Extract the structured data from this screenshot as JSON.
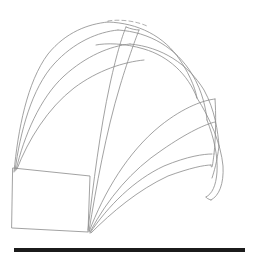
{
  "figure": {
    "canvas": {
      "width": 253,
      "height": 257,
      "background": "#ffffff"
    },
    "style": {
      "curve_color": "#8a8a8a",
      "dashed_color": "#9a9a9a",
      "rule_color": "#1b1b1b",
      "curve_width": 0.8,
      "rule_width": 4
    }
  },
  "chart_data": {
    "type": "line",
    "subtitle": "",
    "xlabel": "",
    "ylabel": "",
    "xlim": [
      0,
      253
    ],
    "ylim": [
      0,
      257
    ],
    "grid": false,
    "legend": "none",
    "annotations": [],
    "tick_labels": {
      "x": [],
      "y": []
    },
    "series": [
      {
        "name": "base-plate-quad",
        "kind": "polygon",
        "points": [
          [
            13,
            168
          ],
          [
            90,
            176
          ],
          [
            88,
            232
          ],
          [
            12,
            228
          ]
        ]
      },
      {
        "name": "ribbon-1-outer-left-edge",
        "kind": "curve",
        "points": [
          [
            14,
            172
          ],
          [
            20,
            110
          ],
          [
            42,
            55
          ],
          [
            78,
            28
          ],
          [
            108,
            22
          ]
        ]
      },
      {
        "name": "ribbon-1-top-arc",
        "kind": "curve",
        "points": [
          [
            108,
            22
          ],
          [
            140,
            24
          ],
          [
            168,
            40
          ],
          [
            186,
            66
          ],
          [
            196,
            96
          ]
        ]
      },
      {
        "name": "ribbon-1-inner-return",
        "kind": "curve",
        "points": [
          [
            196,
            96
          ],
          [
            178,
            70
          ],
          [
            150,
            52
          ],
          [
            118,
            44
          ],
          [
            96,
            44
          ]
        ]
      },
      {
        "name": "ribbon-2-left-edge",
        "kind": "curve",
        "points": [
          [
            15,
            171
          ],
          [
            24,
            116
          ],
          [
            48,
            66
          ],
          [
            82,
            38
          ],
          [
            118,
            30
          ]
        ]
      },
      {
        "name": "ribbon-2-top-arc",
        "kind": "curve",
        "points": [
          [
            118,
            30
          ],
          [
            152,
            34
          ],
          [
            180,
            52
          ],
          [
            198,
            82
          ],
          [
            206,
            118
          ]
        ]
      },
      {
        "name": "ribbon-3-left-edge",
        "kind": "curve",
        "points": [
          [
            16,
            170
          ],
          [
            30,
            122
          ],
          [
            56,
            80
          ],
          [
            92,
            52
          ],
          [
            128,
            44
          ]
        ]
      },
      {
        "name": "ribbon-3-top-arc",
        "kind": "curve",
        "points": [
          [
            128,
            44
          ],
          [
            164,
            48
          ],
          [
            194,
            70
          ],
          [
            212,
            104
          ],
          [
            218,
            144
          ]
        ]
      },
      {
        "name": "ribbon-4-fan-edge",
        "kind": "curve",
        "points": [
          [
            17,
            169
          ],
          [
            36,
            128
          ],
          [
            66,
            92
          ],
          [
            104,
            68
          ],
          [
            142,
            60
          ]
        ]
      },
      {
        "name": "spine-vertical-long",
        "kind": "curve",
        "points": [
          [
            88,
            230
          ],
          [
            96,
            160
          ],
          [
            106,
            96
          ],
          [
            118,
            48
          ],
          [
            126,
            28
          ]
        ]
      },
      {
        "name": "spine-vertical-pair",
        "kind": "curve",
        "points": [
          [
            89,
            231
          ],
          [
            99,
            162
          ],
          [
            112,
            98
          ],
          [
            128,
            50
          ],
          [
            138,
            30
          ]
        ]
      },
      {
        "name": "ribbon-5-right-sweep-outer",
        "kind": "curve",
        "points": [
          [
            89,
            232
          ],
          [
            112,
            170
          ],
          [
            146,
            128
          ],
          [
            186,
            106
          ],
          [
            214,
            100
          ]
        ]
      },
      {
        "name": "ribbon-5-right-sweep-inner",
        "kind": "curve",
        "points": [
          [
            90,
            232
          ],
          [
            118,
            178
          ],
          [
            154,
            144
          ],
          [
            192,
            126
          ],
          [
            214,
            122
          ]
        ]
      },
      {
        "name": "ribbon-6-lower-sweep-outer",
        "kind": "curve",
        "points": [
          [
            90,
            233
          ],
          [
            120,
            192
          ],
          [
            152,
            168
          ],
          [
            186,
            156
          ],
          [
            212,
            154
          ]
        ]
      },
      {
        "name": "ribbon-6-lower-sweep-inner",
        "kind": "curve",
        "points": [
          [
            91,
            233
          ],
          [
            124,
            198
          ],
          [
            158,
            176
          ],
          [
            190,
            166
          ],
          [
            210,
            164
          ]
        ]
      },
      {
        "name": "right-cap-outer-arc",
        "kind": "curve",
        "points": [
          [
            196,
            96
          ],
          [
            214,
            124
          ],
          [
            224,
            156
          ],
          [
            222,
            180
          ],
          [
            210,
            198
          ]
        ]
      },
      {
        "name": "right-cap-inner-arc",
        "kind": "curve",
        "points": [
          [
            206,
            118
          ],
          [
            216,
            142
          ],
          [
            218,
            162
          ],
          [
            212,
            180
          ],
          [
            204,
            192
          ]
        ]
      },
      {
        "name": "right-notch-edge",
        "kind": "curve",
        "points": [
          [
            214,
            100
          ],
          [
            216,
            124
          ],
          [
            214,
            146
          ],
          [
            210,
            160
          ]
        ]
      },
      {
        "name": "dashed-top-segment",
        "kind": "dashed",
        "points": [
          [
            108,
            21
          ],
          [
            122,
            20
          ],
          [
            136,
            22
          ],
          [
            146,
            26
          ]
        ]
      },
      {
        "name": "baseline-rule",
        "kind": "rule",
        "points": [
          [
            14,
            250
          ],
          [
            245,
            250
          ]
        ]
      }
    ]
  }
}
